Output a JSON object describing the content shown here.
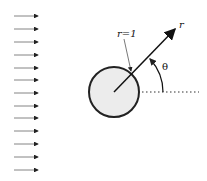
{
  "diagram": {
    "labels": {
      "radius_label": "r=1",
      "radial_axis": "r",
      "angle": "θ"
    },
    "flow_arrows": {
      "count": 13,
      "x_start": 14,
      "x_end": 38,
      "y_positions": [
        16,
        29,
        42,
        55,
        68,
        80,
        93,
        106,
        118,
        131,
        144,
        157,
        170
      ]
    },
    "cylinder": {
      "cx": 114,
      "cy": 92,
      "r": 25,
      "fill": "#ececec",
      "stroke": "#222222"
    },
    "radial_line": {
      "x1": 114,
      "y1": 92,
      "x2": 175,
      "y2": 29
    },
    "reference_line": {
      "x1": 114,
      "y1": 92,
      "x2": 199,
      "y2": 92,
      "style": "dotted"
    },
    "colors": {
      "ink": "#222222",
      "arrow": "#555555"
    }
  }
}
